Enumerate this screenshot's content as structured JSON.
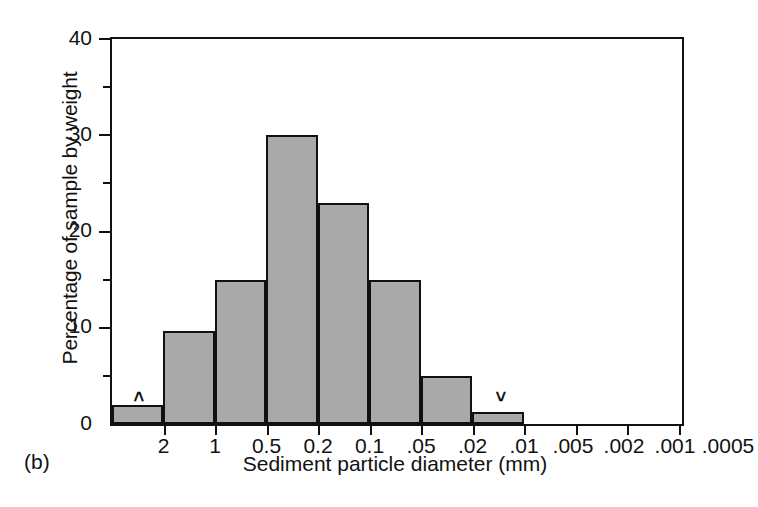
{
  "figure": {
    "panel_label": "(b)",
    "background_color": "#ffffff",
    "bar_fill_color": "#a9a9a9",
    "bar_edge_color": "#111111"
  },
  "chart_data": {
    "type": "bar",
    "title": "",
    "subtitle": "",
    "xlabel": "Sediment particle diameter (mm)",
    "ylabel": "Percentage of sample by weight",
    "categories": [
      "2",
      "1",
      "0.5",
      "0.2",
      "0.1",
      ".05",
      ".02",
      ".01"
    ],
    "values": [
      2,
      9.7,
      15,
      30,
      23,
      15,
      5,
      1.3
    ],
    "x_tick_labels": [
      "2",
      "1",
      "0.5",
      "0.2",
      "0.1",
      ".05",
      ".02",
      ".01",
      ".005",
      ".002",
      ".001",
      ".0005"
    ],
    "y_tick_labels": [
      "0",
      "10",
      "20",
      "30",
      "40"
    ],
    "y_major_ticks": [
      0,
      10,
      20,
      30,
      40
    ],
    "y_minor_ticks": [
      5,
      15,
      25,
      35
    ],
    "ylim": [
      0,
      40
    ],
    "grid": false,
    "legend": null,
    "annotations": [
      {
        "text": ">",
        "bin_index": 0,
        "meaning": "greater-than-coarsest-bin"
      },
      {
        "text": "<",
        "bin_index": 7,
        "meaning": "less-than-finest-bin"
      }
    ],
    "orientation": "vertical",
    "x_axis_scale": "logarithmic-descending"
  }
}
